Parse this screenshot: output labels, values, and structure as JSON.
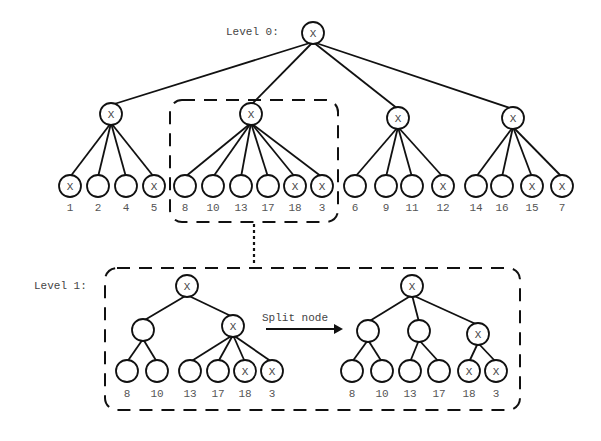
{
  "diagram": {
    "level0_label": "Level 0:",
    "level1_label": "Level 1:",
    "split_label": "Split node",
    "mark": "X",
    "level0": {
      "root": {
        "x": 313,
        "y": 33,
        "marked": true
      },
      "groups": [
        {
          "node": {
            "x": 111,
            "y": 114,
            "marked": true
          },
          "leaves": [
            {
              "x": 70,
              "label": "1",
              "marked": true
            },
            {
              "x": 98,
              "label": "2",
              "marked": false
            },
            {
              "x": 126,
              "label": "4",
              "marked": false
            },
            {
              "x": 154,
              "label": "5",
              "marked": true
            }
          ]
        },
        {
          "node": {
            "x": 251,
            "y": 114,
            "marked": true
          },
          "leaves": [
            {
              "x": 185,
              "label": "8",
              "marked": false
            },
            {
              "x": 213,
              "label": "10",
              "marked": false
            },
            {
              "x": 241,
              "label": "13",
              "marked": false
            },
            {
              "x": 268,
              "label": "17",
              "marked": false
            },
            {
              "x": 295,
              "label": "18",
              "marked": true
            },
            {
              "x": 322,
              "label": "3",
              "marked": true
            }
          ]
        },
        {
          "node": {
            "x": 398,
            "y": 118,
            "marked": true
          },
          "leaves": [
            {
              "x": 355,
              "label": "6",
              "marked": false
            },
            {
              "x": 386,
              "label": "9",
              "marked": false
            },
            {
              "x": 412,
              "label": "11",
              "marked": false
            },
            {
              "x": 443,
              "label": "12",
              "marked": true
            }
          ]
        },
        {
          "node": {
            "x": 513,
            "y": 118,
            "marked": true
          },
          "leaves": [
            {
              "x": 476,
              "label": "14",
              "marked": false
            },
            {
              "x": 502,
              "label": "16",
              "marked": false
            },
            {
              "x": 532,
              "label": "15",
              "marked": true
            },
            {
              "x": 562,
              "label": "7",
              "marked": true
            }
          ]
        }
      ]
    },
    "level1_before": {
      "root": {
        "x": 187,
        "y": 286,
        "marked": true
      },
      "children": [
        {
          "x": 143,
          "y": 330,
          "marked": false,
          "leaves": [
            {
              "x": 127,
              "label": "8",
              "marked": false
            },
            {
              "x": 157,
              "label": "10",
              "marked": false
            }
          ]
        },
        {
          "x": 233,
          "y": 326,
          "marked": true,
          "leaves": [
            {
              "x": 190,
              "label": "13",
              "marked": false
            },
            {
              "x": 218,
              "label": "17",
              "marked": false
            },
            {
              "x": 245,
              "label": "18",
              "marked": true
            },
            {
              "x": 272,
              "label": "3",
              "marked": true
            }
          ]
        }
      ]
    },
    "level1_after": {
      "root": {
        "x": 412,
        "y": 286,
        "marked": true
      },
      "children": [
        {
          "x": 368,
          "y": 331,
          "marked": false,
          "leaves": [
            {
              "x": 352,
              "label": "8",
              "marked": false
            },
            {
              "x": 382,
              "label": "10",
              "marked": false
            }
          ]
        },
        {
          "x": 419,
          "y": 331,
          "marked": false,
          "leaves": [
            {
              "x": 410,
              "label": "13",
              "marked": false
            },
            {
              "x": 439,
              "label": "17",
              "marked": false
            }
          ]
        },
        {
          "x": 478,
          "y": 334,
          "marked": true,
          "leaves": [
            {
              "x": 469,
              "label": "18",
              "marked": true
            },
            {
              "x": 496,
              "label": "3",
              "marked": true
            }
          ]
        }
      ]
    },
    "colors": {
      "stroke": "#111111",
      "text": "#555555",
      "background": "#ffffff"
    }
  }
}
